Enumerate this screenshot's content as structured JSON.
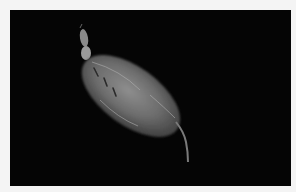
{
  "image": {
    "subject": "copepod / zooplankton specimen",
    "background": "black",
    "border_color": "#f4f4f4",
    "background_color": "#050505",
    "specimen_color": "#8a8a8a"
  }
}
